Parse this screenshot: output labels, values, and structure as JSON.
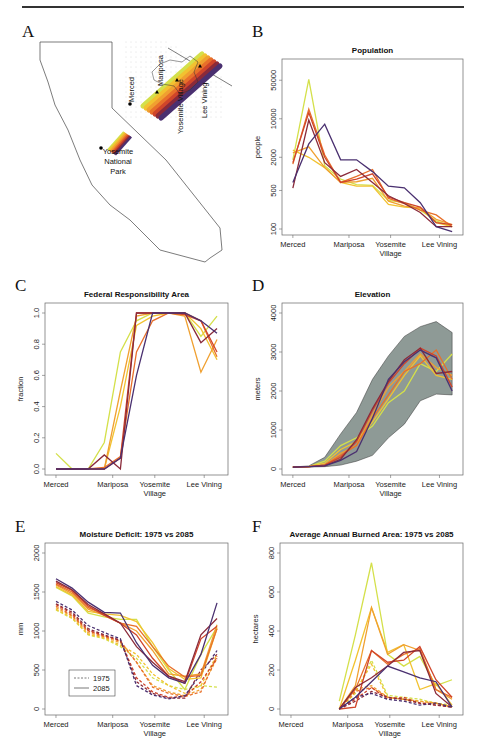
{
  "panels": {
    "A": {
      "letter": "A"
    },
    "B": {
      "letter": "B"
    },
    "C": {
      "letter": "C"
    },
    "D": {
      "letter": "D"
    },
    "E": {
      "letter": "E"
    },
    "F": {
      "letter": "F"
    }
  },
  "map": {
    "labels": [
      "Merced",
      "Mariposa",
      "Yosemite Village",
      "Lee Vining"
    ],
    "park_label": [
      "Yosemite",
      "National",
      "Park"
    ]
  },
  "colors": [
    "#d4e04a",
    "#f2c230",
    "#f0a030",
    "#e8702a",
    "#d0452a",
    "#8a2a3a",
    "#4a3070"
  ],
  "x_categories": [
    "Merced",
    "Mariposa",
    "Yosemite\nVillage",
    "Lee Vining"
  ],
  "chart_data": [
    {
      "panel": "B",
      "type": "line",
      "title": "Population",
      "xlabel": "",
      "ylabel": "people",
      "yscale": "log",
      "ylim": [
        100,
        80000
      ],
      "yticks": [
        100,
        500,
        2000,
        10000,
        50000
      ],
      "categories": [
        "Merced",
        "Mariposa",
        "Yosemite Village",
        "Lee Vining"
      ],
      "x": [
        0,
        1,
        2,
        3,
        4,
        5,
        6,
        7,
        8,
        9,
        10
      ],
      "series": [
        {
          "name": "s1",
          "values": [
            1800,
            52000,
            1400,
            800,
            640,
            620,
            330,
            300,
            220,
            140,
            110
          ]
        },
        {
          "name": "s2",
          "values": [
            2700,
            2000,
            1300,
            700,
            600,
            600,
            280,
            250,
            240,
            130,
            110
          ]
        },
        {
          "name": "s3",
          "values": [
            2400,
            3100,
            1300,
            700,
            720,
            830,
            320,
            260,
            240,
            150,
            120
          ]
        },
        {
          "name": "s4",
          "values": [
            1500,
            15000,
            2200,
            700,
            900,
            1200,
            360,
            290,
            220,
            180,
            110
          ]
        },
        {
          "name": "s5",
          "values": [
            1600,
            13000,
            2000,
            700,
            800,
            1000,
            380,
            300,
            250,
            130,
            120
          ]
        },
        {
          "name": "s6",
          "values": [
            550,
            9500,
            1600,
            900,
            1200,
            700,
            400,
            290,
            200,
            110,
            110
          ]
        },
        {
          "name": "s7",
          "values": [
            700,
            3500,
            8000,
            1800,
            1800,
            1100,
            600,
            560,
            300,
            110,
            90
          ]
        }
      ]
    },
    {
      "panel": "C",
      "type": "line",
      "title": "Federal Responsibility Area",
      "ylabel": "fraction",
      "ylim": [
        0,
        1
      ],
      "yticks": [
        0.0,
        0.2,
        0.4,
        0.6,
        0.8,
        1.0
      ],
      "categories": [
        "Merced",
        "Mariposa",
        "Yosemite Village",
        "Lee Vining"
      ],
      "x": [
        0,
        1,
        2,
        3,
        4,
        5,
        6,
        7,
        8,
        9,
        10
      ],
      "series": [
        {
          "name": "s1",
          "values": [
            0.1,
            0.0,
            0.0,
            0.17,
            0.75,
            0.95,
            1.0,
            1.0,
            1.0,
            0.85,
            0.98
          ]
        },
        {
          "name": "s2",
          "values": [
            0.0,
            0.0,
            0.0,
            0.0,
            0.4,
            0.92,
            0.98,
            1.0,
            1.0,
            0.9,
            0.7
          ]
        },
        {
          "name": "s3",
          "values": [
            0.0,
            0.0,
            0.0,
            0.0,
            0.5,
            0.98,
            1.0,
            1.0,
            0.98,
            0.62,
            0.83
          ]
        },
        {
          "name": "s4",
          "values": [
            0.0,
            0.0,
            0.0,
            0.01,
            0.08,
            0.75,
            0.95,
            1.0,
            1.0,
            0.95,
            0.72
          ]
        },
        {
          "name": "s5",
          "values": [
            0.0,
            0.0,
            0.0,
            0.0,
            0.07,
            1.0,
            1.0,
            1.0,
            0.99,
            0.95,
            0.75
          ]
        },
        {
          "name": "s6",
          "values": [
            0.0,
            0.0,
            0.0,
            0.09,
            0.0,
            1.0,
            1.0,
            1.0,
            1.0,
            0.81,
            0.9
          ]
        },
        {
          "name": "s7",
          "values": [
            0.0,
            0.0,
            0.0,
            0.0,
            0.07,
            0.6,
            1.0,
            1.0,
            1.0,
            0.95,
            0.87
          ]
        }
      ]
    },
    {
      "panel": "D",
      "type": "line",
      "title": "Elevation",
      "ylabel": "meters",
      "ylim": [
        0,
        4000
      ],
      "yticks": [
        0,
        1000,
        2000,
        3000,
        4000
      ],
      "categories": [
        "Merced",
        "Mariposa",
        "Yosemite Village",
        "Lee Vining"
      ],
      "x": [
        0,
        1,
        2,
        3,
        4,
        5,
        6,
        7,
        8,
        9,
        10
      ],
      "band_upper": [
        50,
        80,
        300,
        900,
        1450,
        2300,
        2900,
        3400,
        3650,
        3780,
        3500
      ],
      "band_lower": [
        50,
        50,
        60,
        100,
        200,
        350,
        800,
        1150,
        1750,
        1920,
        1900
      ],
      "series": [
        {
          "name": "s1",
          "values": [
            50,
            60,
            200,
            600,
            800,
            1100,
            1700,
            2000,
            2700,
            2500,
            2950
          ]
        },
        {
          "name": "s2",
          "values": [
            50,
            60,
            150,
            500,
            700,
            1200,
            1800,
            2400,
            2900,
            2400,
            2300
          ]
        },
        {
          "name": "s3",
          "values": [
            50,
            60,
            100,
            400,
            600,
            1400,
            2100,
            2500,
            2950,
            2600,
            2400
          ]
        },
        {
          "name": "s4",
          "values": [
            50,
            60,
            100,
            350,
            600,
            1300,
            1900,
            2500,
            2700,
            3050,
            2300
          ]
        },
        {
          "name": "s5",
          "values": [
            50,
            60,
            100,
            300,
            700,
            1500,
            2200,
            2700,
            3100,
            2900,
            2100
          ]
        },
        {
          "name": "s6",
          "values": [
            50,
            60,
            80,
            250,
            750,
            1550,
            2250,
            2800,
            3100,
            2450,
            2500
          ]
        },
        {
          "name": "s7",
          "values": [
            50,
            60,
            80,
            220,
            450,
            1300,
            2300,
            2750,
            3050,
            2850,
            2000
          ]
        }
      ]
    },
    {
      "panel": "E",
      "type": "line",
      "title": "Moisture Deficit: 1975 vs 2085",
      "ylabel": "mm",
      "ylim": [
        0,
        2000
      ],
      "yticks": [
        0,
        500,
        1000,
        1500,
        2000
      ],
      "categories": [
        "Merced",
        "Mariposa",
        "Yosemite Village",
        "Lee Vining"
      ],
      "legend": [
        {
          "label": "1975",
          "style": "dashed"
        },
        {
          "label": "2085",
          "style": "solid"
        }
      ],
      "legend_position": "lower left",
      "x": [
        0,
        1,
        2,
        3,
        4,
        5,
        6,
        7,
        8,
        9,
        10
      ],
      "series_2085": [
        {
          "name": "s1",
          "values": [
            1560,
            1450,
            1230,
            1180,
            1150,
            1150,
            800,
            500,
            250,
            700,
            1050
          ]
        },
        {
          "name": "s2",
          "values": [
            1570,
            1460,
            1250,
            1220,
            1200,
            1120,
            850,
            520,
            380,
            400,
            1030
          ]
        },
        {
          "name": "s3",
          "values": [
            1590,
            1480,
            1280,
            1200,
            1100,
            1000,
            750,
            450,
            420,
            450,
            1080
          ]
        },
        {
          "name": "s4",
          "values": [
            1600,
            1500,
            1300,
            1220,
            1100,
            1060,
            800,
            550,
            410,
            430,
            1030
          ]
        },
        {
          "name": "s5",
          "values": [
            1620,
            1520,
            1320,
            1200,
            1100,
            950,
            650,
            420,
            330,
            900,
            1060
          ]
        },
        {
          "name": "s6",
          "values": [
            1640,
            1530,
            1340,
            1220,
            1100,
            800,
            600,
            420,
            350,
            950,
            1160
          ]
        },
        {
          "name": "s7",
          "values": [
            1670,
            1550,
            1370,
            1240,
            1230,
            850,
            560,
            400,
            330,
            700,
            1360
          ]
        }
      ],
      "series_1975": [
        {
          "name": "s1",
          "values": [
            1270,
            1160,
            950,
            900,
            800,
            650,
            400,
            300,
            250,
            300,
            280
          ]
        },
        {
          "name": "s2",
          "values": [
            1280,
            1170,
            960,
            910,
            820,
            700,
            450,
            300,
            200,
            300,
            700
          ]
        },
        {
          "name": "s3",
          "values": [
            1300,
            1190,
            980,
            920,
            850,
            600,
            300,
            220,
            170,
            250,
            650
          ]
        },
        {
          "name": "s4",
          "values": [
            1320,
            1200,
            1000,
            930,
            870,
            600,
            280,
            200,
            160,
            220,
            680
          ]
        },
        {
          "name": "s5",
          "values": [
            1340,
            1220,
            1010,
            940,
            880,
            400,
            220,
            150,
            160,
            350,
            650
          ]
        },
        {
          "name": "s6",
          "values": [
            1350,
            1240,
            1030,
            950,
            880,
            350,
            200,
            140,
            140,
            500,
            700
          ]
        },
        {
          "name": "s7",
          "values": [
            1380,
            1270,
            1070,
            980,
            900,
            300,
            180,
            130,
            170,
            450,
            750
          ]
        }
      ]
    },
    {
      "panel": "F",
      "type": "line",
      "title": "Average Annual Burned Area: 1975 vs 2085",
      "ylabel": "hectares",
      "ylim": [
        0,
        800
      ],
      "yticks": [
        0,
        200,
        400,
        600,
        800
      ],
      "categories": [
        "Merced",
        "Mariposa",
        "Yosemite Village",
        "Lee Vining"
      ],
      "x": [
        0,
        1,
        2,
        3,
        4,
        5,
        6,
        7,
        8,
        9,
        10
      ],
      "series_2085": [
        {
          "name": "s1",
          "values": [
            null,
            null,
            null,
            40,
            380,
            750,
            280,
            220,
            270,
            120,
            150
          ]
        },
        {
          "name": "s2",
          "values": [
            null,
            null,
            null,
            0,
            250,
            520,
            290,
            330,
            100,
            130,
            20
          ]
        },
        {
          "name": "s3",
          "values": [
            null,
            null,
            null,
            0,
            120,
            520,
            280,
            330,
            300,
            100,
            50
          ]
        },
        {
          "name": "s4",
          "values": [
            null,
            null,
            null,
            0,
            100,
            300,
            230,
            280,
            310,
            100,
            60
          ]
        },
        {
          "name": "s5",
          "values": [
            null,
            null,
            null,
            0,
            10,
            300,
            240,
            250,
            320,
            150,
            60
          ]
        },
        {
          "name": "s6",
          "values": [
            null,
            null,
            null,
            0,
            110,
            160,
            220,
            290,
            300,
            80,
            10
          ]
        },
        {
          "name": "s7",
          "values": [
            null,
            null,
            null,
            0,
            60,
            140,
            220,
            190,
            160,
            140,
            10
          ]
        }
      ],
      "series_1975": [
        {
          "name": "s1",
          "values": [
            null,
            null,
            null,
            0,
            80,
            250,
            70,
            60,
            50,
            30,
            20
          ]
        },
        {
          "name": "s2",
          "values": [
            null,
            null,
            null,
            0,
            90,
            230,
            60,
            50,
            40,
            30,
            10
          ]
        },
        {
          "name": "s3",
          "values": [
            null,
            null,
            null,
            0,
            100,
            120,
            60,
            50,
            40,
            30,
            10
          ]
        },
        {
          "name": "s4",
          "values": [
            null,
            null,
            null,
            0,
            90,
            110,
            60,
            50,
            30,
            30,
            10
          ]
        },
        {
          "name": "s5",
          "values": [
            null,
            null,
            null,
            0,
            50,
            110,
            50,
            60,
            30,
            20,
            10
          ]
        },
        {
          "name": "s6",
          "values": [
            null,
            null,
            null,
            0,
            40,
            90,
            60,
            50,
            30,
            20,
            10
          ]
        },
        {
          "name": "s7",
          "values": [
            null,
            null,
            null,
            0,
            60,
            80,
            50,
            40,
            20,
            30,
            10
          ]
        }
      ]
    }
  ]
}
